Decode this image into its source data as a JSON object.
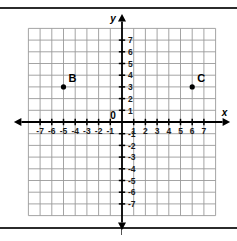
{
  "chart_data": {
    "type": "scatter",
    "title": "",
    "xlabel": "x",
    "ylabel": "y",
    "xlim": [
      -8,
      8
    ],
    "ylim": [
      -8,
      8
    ],
    "grid": true,
    "legend": "none",
    "origin_label": "0",
    "x_tick_labels": [
      "-7",
      "-6",
      "-5",
      "-4",
      "-3",
      "-2",
      "-1",
      "1",
      "2",
      "3",
      "4",
      "5",
      "6",
      "7"
    ],
    "y_tick_labels": [
      "7",
      "6",
      "5",
      "4",
      "3",
      "2",
      "1",
      "-1",
      "-2",
      "-3",
      "-4",
      "-5",
      "-6",
      "-7"
    ],
    "points": [
      {
        "label": "B",
        "x": -5,
        "y": 3
      },
      {
        "label": "C",
        "x": 6,
        "y": 3
      }
    ],
    "colors": {
      "grid": "#9a9a9a",
      "axis": "#000000",
      "point": "#000000",
      "background": "#ffffff",
      "rule": "#2b2b2b"
    }
  }
}
